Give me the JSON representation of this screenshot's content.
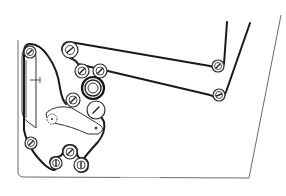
{
  "diagram": {
    "type": "film-threading-path",
    "colors": {
      "line": "#1a1a1a",
      "frame": "#6a6a6a",
      "background": "#ffffff",
      "accent_bottom": "#9ad29a"
    },
    "rollers": [
      {
        "id": "top-left-guide",
        "cx": 70,
        "cy": 50,
        "r": 8
      },
      {
        "id": "upper-pair-left",
        "cx": 82,
        "cy": 71,
        "r": 7
      },
      {
        "id": "upper-pair-right",
        "cx": 100,
        "cy": 71,
        "r": 7
      },
      {
        "id": "main-drum",
        "cx": 93,
        "cy": 88,
        "r": 10
      },
      {
        "id": "mid-left",
        "cx": 73,
        "cy": 100,
        "r": 7
      },
      {
        "id": "mid-right",
        "cx": 96,
        "cy": 110,
        "r": 9
      },
      {
        "id": "arm-top",
        "cx": 30,
        "cy": 52,
        "r": 6
      },
      {
        "id": "bottom-left",
        "cx": 31,
        "cy": 143,
        "r": 6
      },
      {
        "id": "bottom-center-top",
        "cx": 70,
        "cy": 152,
        "r": 7
      },
      {
        "id": "bottom-center-left",
        "cx": 56,
        "cy": 163,
        "r": 6
      },
      {
        "id": "bottom-center-right",
        "cx": 81,
        "cy": 165,
        "r": 7
      },
      {
        "id": "right-upper",
        "cx": 218,
        "cy": 66,
        "r": 6
      },
      {
        "id": "right-lower",
        "cx": 219,
        "cy": 95,
        "r": 6
      }
    ],
    "sprocket": {
      "cx": 52,
      "cy": 119,
      "r": 5
    }
  }
}
